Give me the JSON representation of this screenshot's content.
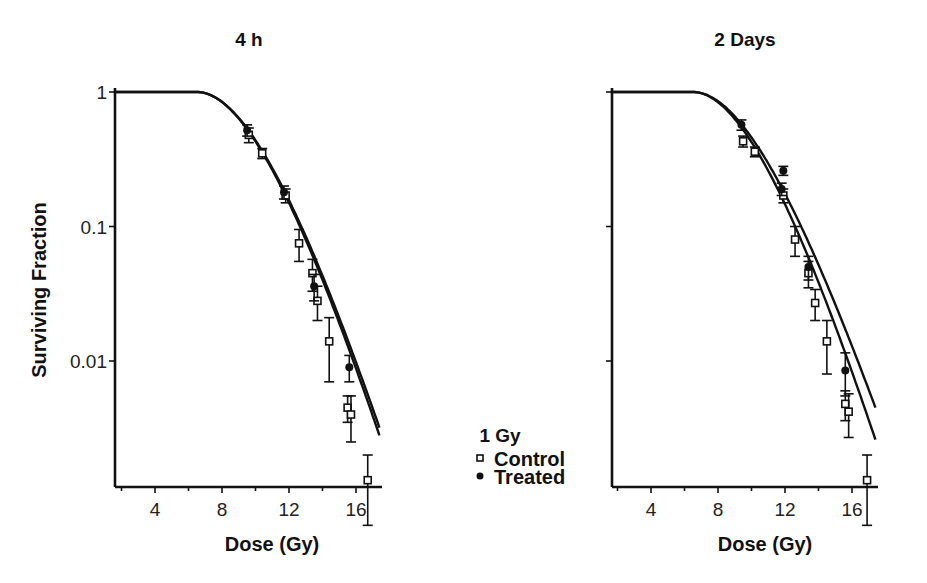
{
  "figure": {
    "legend": {
      "title": "1 Gy",
      "items": [
        {
          "label": "Control",
          "marker": "open-square"
        },
        {
          "label": "Treated",
          "marker": "filled-circle"
        }
      ]
    },
    "colors": {
      "ink": "#111111",
      "background": "#ffffff"
    }
  },
  "chart_data": [
    {
      "type": "scatter",
      "title": "4 h",
      "xlabel": "Dose (Gy)",
      "ylabel": "Surviving Fraction",
      "yscale": "log",
      "xlim": [
        1.6,
        17.5
      ],
      "ylim": [
        0.0015,
        1
      ],
      "xticks": [
        4,
        8,
        12,
        16
      ],
      "yticks": [
        1,
        0.1,
        0.01
      ],
      "ytick_labels": [
        "1",
        "0.1",
        "0.01"
      ],
      "grid": false,
      "legend_position": "between panels, lower",
      "series": [
        {
          "name": "Control",
          "marker": "open-square",
          "points": [
            {
              "x": 9.6,
              "y": 0.48,
              "err": 0.06
            },
            {
              "x": 10.4,
              "y": 0.35,
              "err": 0.03
            },
            {
              "x": 11.8,
              "y": 0.17,
              "err": 0.02
            },
            {
              "x": 12.6,
              "y": 0.075,
              "err": 0.02
            },
            {
              "x": 13.4,
              "y": 0.045,
              "err": 0.012
            },
            {
              "x": 13.7,
              "y": 0.028,
              "err": 0.008
            },
            {
              "x": 14.4,
              "y": 0.014,
              "err": 0.007
            },
            {
              "x": 15.5,
              "y": 0.0045,
              "err": 0.001
            },
            {
              "x": 15.7,
              "y": 0.004,
              "err": 0.0015
            },
            {
              "x": 16.7,
              "y": 0.0013,
              "err": 0.0007
            }
          ]
        },
        {
          "name": "Treated",
          "marker": "filled-circle",
          "points": [
            {
              "x": 9.5,
              "y": 0.52,
              "err": 0.05
            },
            {
              "x": 11.7,
              "y": 0.18,
              "err": 0.02
            },
            {
              "x": 13.5,
              "y": 0.036,
              "err": 0.008
            },
            {
              "x": 15.6,
              "y": 0.009,
              "err": 0.002
            }
          ]
        }
      ],
      "fit_curves": [
        {
          "name": "Control fit",
          "shoulder_end_dose": 6.5,
          "end": {
            "x": 17.4,
            "y": 0.0028
          }
        },
        {
          "name": "Treated fit",
          "shoulder_end_dose": 6.5,
          "end": {
            "x": 17.4,
            "y": 0.0032
          }
        }
      ]
    },
    {
      "type": "scatter",
      "title": "2 Days",
      "xlabel": "Dose (Gy)",
      "ylabel": "",
      "yscale": "log",
      "xlim": [
        1.6,
        17.5
      ],
      "ylim": [
        0.0015,
        1
      ],
      "xticks": [
        4,
        8,
        12,
        16
      ],
      "yticks": [
        1,
        0.1,
        0.01
      ],
      "ytick_labels": [
        "",
        "",
        ""
      ],
      "grid": false,
      "series": [
        {
          "name": "Control",
          "marker": "open-square",
          "points": [
            {
              "x": 9.5,
              "y": 0.43,
              "err": 0.04
            },
            {
              "x": 10.2,
              "y": 0.36,
              "err": 0.03
            },
            {
              "x": 11.9,
              "y": 0.17,
              "err": 0.02
            },
            {
              "x": 12.6,
              "y": 0.08,
              "err": 0.02
            },
            {
              "x": 13.4,
              "y": 0.045,
              "err": 0.01
            },
            {
              "x": 13.8,
              "y": 0.027,
              "err": 0.007
            },
            {
              "x": 14.5,
              "y": 0.014,
              "err": 0.006
            },
            {
              "x": 15.6,
              "y": 0.0048,
              "err": 0.0012
            },
            {
              "x": 15.8,
              "y": 0.0042,
              "err": 0.0015
            },
            {
              "x": 16.9,
              "y": 0.0013,
              "err": 0.0007
            }
          ]
        },
        {
          "name": "Treated",
          "marker": "filled-circle",
          "points": [
            {
              "x": 9.4,
              "y": 0.57,
              "err": 0.05
            },
            {
              "x": 11.9,
              "y": 0.26,
              "err": 0.02
            },
            {
              "x": 11.8,
              "y": 0.19,
              "err": 0.02
            },
            {
              "x": 13.4,
              "y": 0.05,
              "err": 0.01
            },
            {
              "x": 15.6,
              "y": 0.0085,
              "err": 0.003
            }
          ]
        }
      ],
      "fit_curves": [
        {
          "name": "Control fit",
          "shoulder_end_dose": 6.5,
          "end": {
            "x": 17.4,
            "y": 0.0026
          }
        },
        {
          "name": "Treated fit",
          "shoulder_end_dose": 6.5,
          "end": {
            "x": 17.4,
            "y": 0.0045
          }
        }
      ]
    }
  ]
}
